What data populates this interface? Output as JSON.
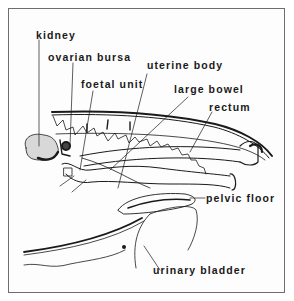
{
  "diagram": {
    "type": "anatomical sagittal section line drawing",
    "labels": {
      "kidney": "kidney",
      "ovarian_bursa": "ovarian bursa",
      "foetal_unit": "foetal unit",
      "uterine_body": "uterine body",
      "large_bowel": "large bowel",
      "rectum": "rectum",
      "pelvic_floor": "pelvic floor",
      "urinary_bladder": "urinary bladder"
    },
    "colors": {
      "ink": "#1a1a1a",
      "frame": "#6e6e6e",
      "background": "#ffffff"
    }
  }
}
